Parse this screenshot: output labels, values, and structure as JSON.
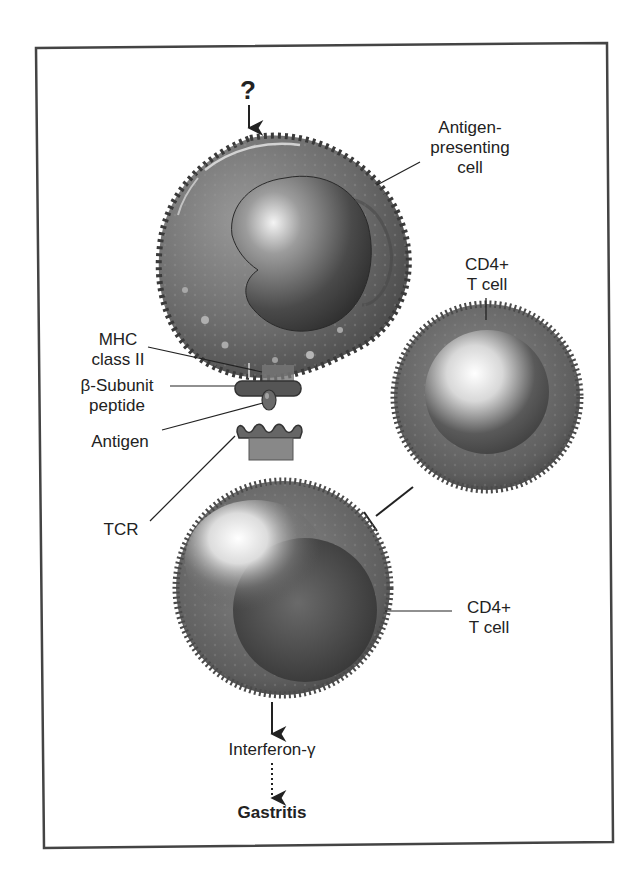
{
  "figure": {
    "top_marker": "?",
    "labels": {
      "apc": [
        "Antigen-",
        "presenting",
        "cell"
      ],
      "cd4_right": [
        "CD4+",
        "T cell"
      ],
      "mhc": [
        "MHC",
        "class II"
      ],
      "peptide": [
        "β-Subunit",
        "peptide"
      ],
      "antigen": "Antigen",
      "tcr": "TCR",
      "cd4_bottom": [
        "CD4+",
        "T cell"
      ],
      "interferon": "Interferon-γ",
      "gastritis": "Gastritis"
    },
    "relations": [
      {
        "from": "?",
        "to": "Antigen-presenting cell",
        "type": "arrow"
      },
      {
        "from": "CD4+ T cell (right)",
        "to": "CD4+ T cell (bottom)",
        "type": "inhibition"
      },
      {
        "from": "CD4+ T cell (bottom)",
        "to": "Interferon-γ",
        "type": "arrow"
      },
      {
        "from": "Interferon-γ",
        "to": "Gastritis",
        "type": "dotted-arrow"
      }
    ],
    "colors": {
      "frame": "#444444",
      "cell_dark": "#3a3a3a",
      "cell_mid": "#6e6e6e",
      "highlight": "#ffffff",
      "text": "#222222"
    }
  }
}
